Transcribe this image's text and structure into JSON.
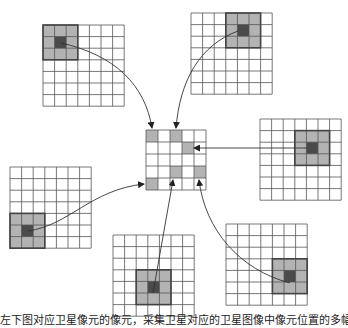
{
  "colors": {
    "grid_line": "#555555",
    "window_fill": "#b3b3b3",
    "window_border": "#444444",
    "center_pixel": "#4a4a4a",
    "arrow": "#333333",
    "target_fill": "#b3b3b3"
  },
  "source_grids": [
    {
      "id": "top-left",
      "x": 43,
      "y": 25,
      "size": 7,
      "cell": 11.6,
      "window": {
        "col": 0,
        "row": 0
      },
      "center": {
        "col": 1,
        "row": 1
      }
    },
    {
      "id": "top-right",
      "x": 191,
      "y": 13,
      "size": 7,
      "cell": 11.6,
      "window": {
        "col": 3,
        "row": 0
      },
      "center": {
        "col": 4,
        "row": 1
      }
    },
    {
      "id": "right",
      "x": 260,
      "y": 119,
      "size": 7,
      "cell": 11.6,
      "window": {
        "col": 3,
        "row": 1
      },
      "center": {
        "col": 4,
        "row": 2
      }
    },
    {
      "id": "left",
      "x": 10,
      "y": 167,
      "size": 7,
      "cell": 11.6,
      "window": {
        "col": 0,
        "row": 4
      },
      "center": {
        "col": 1,
        "row": 5
      }
    },
    {
      "id": "bottom-center",
      "x": 113,
      "y": 235,
      "size": 7,
      "cell": 11.6,
      "window": {
        "col": 2,
        "row": 3
      },
      "center": {
        "col": 3,
        "row": 4
      }
    },
    {
      "id": "bottom-right",
      "x": 226,
      "y": 224,
      "size": 7,
      "cell": 11.6,
      "window": {
        "col": 4,
        "row": 3
      },
      "center": {
        "col": 5,
        "row": 4
      }
    }
  ],
  "target_grid": {
    "x": 146,
    "y": 130,
    "size": 5,
    "cell": 12,
    "filled_cells": [
      {
        "col": 0,
        "row": 0
      },
      {
        "col": 2,
        "row": 0
      },
      {
        "col": 3,
        "row": 1
      },
      {
        "col": 2,
        "row": 3
      },
      {
        "col": 4,
        "row": 3
      },
      {
        "col": 0,
        "row": 4
      }
    ]
  },
  "arrows": [
    {
      "from": "top-left",
      "path": "M61,43 C115,55 145,85 152,128"
    },
    {
      "from": "top-right",
      "path": "M238,31 C200,45 180,80 176,128"
    },
    {
      "from": "right",
      "path": "M307,148 L194,148"
    },
    {
      "from": "left",
      "path": "M28,231 C70,225 90,190 144,184"
    },
    {
      "from": "bottom-center",
      "path": "M153,293 L173,180"
    },
    {
      "from": "bottom-right",
      "path": "M290,283 C240,270 205,230 199,180"
    }
  ],
  "caption": "左下图对应卫星像元的像元，采集卫星对应的卫星图像中像元位置的多幅影像"
}
